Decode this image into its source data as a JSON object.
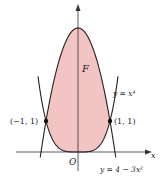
{
  "figure": {
    "region_label": "F",
    "origin_label": "O",
    "x_axis_label": "x",
    "curve_upper_label": "y = 4 − 3x²",
    "curve_lower_label": "y = x⁴",
    "point_left_label": "(−1, 1)",
    "point_right_label": "(1, 1)",
    "fill_color": "#f2c4c4",
    "curve_color": "#2a2020",
    "point_left": {
      "x": -1,
      "y": 1
    },
    "point_right": {
      "x": 1,
      "y": 1
    },
    "upper_curve": "4-3x^2",
    "lower_curve": "x^4"
  }
}
